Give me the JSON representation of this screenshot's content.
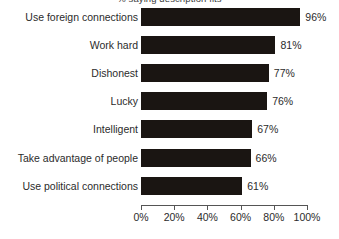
{
  "chart_data": {
    "type": "bar",
    "orientation": "horizontal",
    "title": "% saying description fits",
    "xlabel": "",
    "ylabel": "",
    "categories": [
      "Use foreign connections",
      "Work hard",
      "Dishonest",
      "Lucky",
      "Intelligent",
      "Take advantage of people",
      "Use political connections"
    ],
    "values": [
      96,
      81,
      77,
      76,
      67,
      66,
      61
    ],
    "value_labels": [
      "96%",
      "81%",
      "77%",
      "76%",
      "67%",
      "66%",
      "61%"
    ],
    "xlim": [
      0,
      100
    ],
    "xticks": [
      0,
      20,
      40,
      60,
      80,
      100
    ],
    "xtick_labels": [
      "0%",
      "20%",
      "40%",
      "60%",
      "80%",
      "100%"
    ],
    "grid": false,
    "legend": false,
    "bar_color": "#1a1512",
    "axis_color": "#555555",
    "text_color": "#2b2b2b",
    "background_color": "#ffffff"
  }
}
